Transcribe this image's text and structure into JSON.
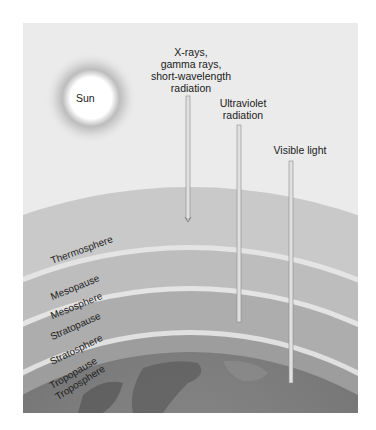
{
  "figure": {
    "sun_label": "Sun",
    "rays": [
      {
        "label_lines": [
          "X-rays,",
          "gamma rays,",
          "short-wavelength",
          "radiation"
        ],
        "ends_in": "Thermosphere"
      },
      {
        "label_lines": [
          "Ultraviolet",
          "radiation"
        ],
        "ends_in": "Stratosphere"
      },
      {
        "label_lines": [
          "Visible light"
        ],
        "ends_in": "Troposphere"
      }
    ],
    "layers": [
      {
        "label": "Thermosphere"
      },
      {
        "label": "Mesopause"
      },
      {
        "label": "Mesosphere"
      },
      {
        "label": "Stratopause"
      },
      {
        "label": "Stratosphere"
      },
      {
        "label": "Tropopause"
      },
      {
        "label": "Troposphere"
      }
    ],
    "colors": {
      "background": "#ebebeb",
      "thermosphere": "#c9c9c9",
      "mesosphere": "#bdbdbd",
      "stratosphere": "#acacac",
      "troposphere": "#9e9e9e",
      "boundary": "#e8e8e8",
      "earth": "#6e6e6e"
    }
  }
}
